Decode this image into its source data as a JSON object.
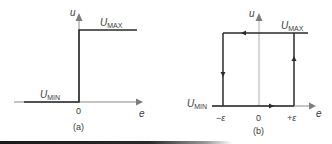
{
  "panels": [
    {
      "id": "a",
      "caption": "(a)",
      "type": "ideal relay (on-off) characteristic",
      "axes": {
        "x_label": "e",
        "y_label": "u",
        "origin_label": "0"
      },
      "levels": {
        "max_label_base": "U",
        "max_label_sub": "MAX",
        "min_label_base": "U",
        "min_label_sub": "MIN"
      }
    },
    {
      "id": "b",
      "caption": "(b)",
      "type": "relay with hysteresis characteristic",
      "axes": {
        "x_label": "e",
        "y_label": "u",
        "origin_label": "0"
      },
      "thresholds": {
        "negative": "−ε",
        "positive": "+ε"
      },
      "levels": {
        "max_label_base": "U",
        "max_label_sub": "MAX",
        "min_label_base": "U",
        "min_label_sub": "MIN"
      },
      "loop_direction": [
        "right along U_MIN",
        "up at +ε",
        "left along U_MAX",
        "down at −ε"
      ]
    }
  ],
  "colors": {
    "line": "#2b2b2b",
    "axis": "#8a8a8a",
    "arrowhead": "#7d7d7d",
    "text": "#3a3a3a"
  }
}
